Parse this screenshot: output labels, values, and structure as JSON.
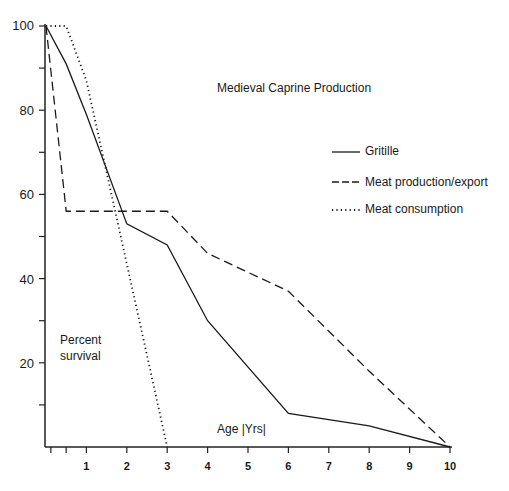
{
  "chart_data": {
    "type": "line",
    "title": "Medieval Caprine Production",
    "xlabel": "Age (Yrs)",
    "ylabel": "Percent survival",
    "xlim": [
      0,
      10
    ],
    "ylim": [
      0,
      100
    ],
    "x_ticks": [
      "1",
      "2",
      "3",
      "4",
      "5",
      "6",
      "7",
      "8",
      "9",
      "10"
    ],
    "y_ticks": [
      "100",
      "80",
      "60",
      "40",
      "20"
    ],
    "grid": false,
    "legend_position": "upper right",
    "series": [
      {
        "name": "Gritille",
        "style": "solid",
        "x": [
          0,
          0.5,
          1,
          2,
          3,
          4,
          6,
          8,
          10
        ],
        "y": [
          100,
          91,
          79,
          53,
          48,
          30,
          8,
          5,
          0
        ]
      },
      {
        "name": "Meat production/export",
        "style": "dashed",
        "x": [
          0,
          0.5,
          3,
          4,
          6,
          8,
          10
        ],
        "y": [
          100,
          56,
          56,
          46,
          37,
          18,
          0
        ]
      },
      {
        "name": "Meat consumption",
        "style": "dotted",
        "x": [
          0,
          0.5,
          1,
          3
        ],
        "y": [
          100,
          100,
          87,
          0
        ]
      }
    ]
  },
  "labels": {
    "title": "Medieval Caprine Production",
    "xlabel": "Age |Yrs|",
    "ylabel_line1": "Percent",
    "ylabel_line2": "survival",
    "legend": [
      "Gritille",
      "Meat  production/export",
      "Meat  consumption"
    ]
  }
}
